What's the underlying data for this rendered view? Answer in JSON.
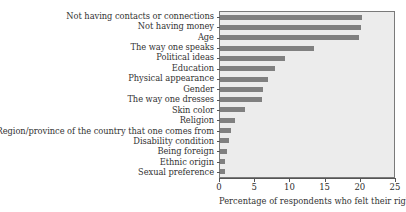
{
  "chart_data": {
    "type": "bar",
    "orientation": "horizontal",
    "title": "",
    "xlabel": "Percentage of respondents who felt their rights",
    "ylabel": "",
    "xlim": [
      0,
      25
    ],
    "xticks": [
      0,
      5,
      10,
      15,
      20,
      25
    ],
    "grid": false,
    "legend": null,
    "bar_color": "#808080",
    "plot_background": "#ececec",
    "categories": [
      "Not having contacts or connections",
      "Not having money",
      "Age",
      "The way one speaks",
      "Political ideas",
      "Education",
      "Physical appearance",
      "Gender",
      "The way one dresses",
      "Skin color",
      "Religion",
      "Region/province of the country that one comes from",
      "Disability condition",
      "Being foreign",
      "Ethnic origin",
      "Sexual preference"
    ],
    "values": [
      20.1,
      20.0,
      19.7,
      13.3,
      9.2,
      7.8,
      6.8,
      6.1,
      6.0,
      3.6,
      2.1,
      1.5,
      1.3,
      1.0,
      0.7,
      0.7
    ]
  }
}
